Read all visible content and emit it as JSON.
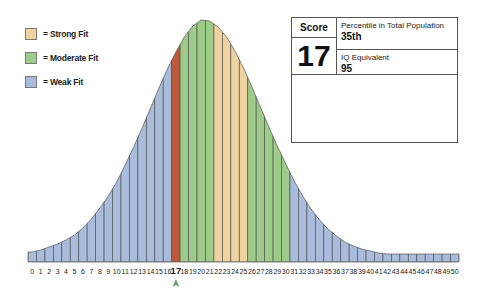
{
  "legend": [
    {
      "label": "= Strong Fit",
      "color": "#f0d3a0"
    },
    {
      "label": "= Moderate Fit",
      "color": "#9ccc88"
    },
    {
      "label": "= Weak Fit",
      "color": "#a9bcdc"
    }
  ],
  "score_box": {
    "score_header": "Score",
    "score_value": "17",
    "percentile_label": "Percentile in Total Population",
    "percentile_value": "35th",
    "iq_label": "IQ Equivalent",
    "iq_value": "95"
  },
  "colors": {
    "strong": "#f0d3a0",
    "moderate": "#9ccc88",
    "weak": "#a9bcdc",
    "current": "#c0583a",
    "marker": "#6aa06a",
    "bar_outline": "#555555"
  },
  "chart_data": {
    "type": "bar",
    "title": "",
    "xlabel": "",
    "ylabel": "",
    "categories": [
      "0",
      "1",
      "2",
      "3",
      "4",
      "5",
      "6",
      "7",
      "8",
      "9",
      "10",
      "11",
      "12",
      "13",
      "14",
      "15",
      "16",
      "17",
      "18",
      "19",
      "20",
      "21",
      "22",
      "23",
      "24",
      "25",
      "26",
      "27",
      "28",
      "29",
      "30",
      "31",
      "32",
      "33",
      "34",
      "35",
      "36",
      "37",
      "38",
      "39",
      "40",
      "41",
      "42",
      "43",
      "44",
      "45",
      "46",
      "47",
      "48",
      "49",
      "50"
    ],
    "values": [
      10,
      12,
      15,
      18,
      22,
      27,
      34,
      43,
      54,
      66,
      80,
      97,
      115,
      134,
      154,
      174,
      193,
      210,
      225,
      236,
      242,
      241,
      235,
      225,
      211,
      194,
      175,
      155,
      135,
      116,
      98,
      81,
      66,
      53,
      42,
      33,
      26,
      20,
      16,
      13,
      11,
      9,
      8,
      8,
      8,
      8,
      8,
      8,
      8,
      8,
      8
    ],
    "bar_category": [
      "weak",
      "weak",
      "weak",
      "weak",
      "weak",
      "weak",
      "weak",
      "weak",
      "weak",
      "weak",
      "weak",
      "weak",
      "weak",
      "weak",
      "weak",
      "weak",
      "weak",
      "current",
      "moderate",
      "moderate",
      "moderate",
      "moderate",
      "strong",
      "strong",
      "strong",
      "strong",
      "moderate",
      "moderate",
      "moderate",
      "moderate",
      "moderate",
      "weak",
      "weak",
      "weak",
      "weak",
      "weak",
      "weak",
      "weak",
      "weak",
      "weak",
      "weak",
      "weak",
      "weak",
      "weak",
      "weak",
      "weak",
      "weak",
      "weak",
      "weak",
      "weak",
      "weak"
    ],
    "highlighted_score": 17,
    "legend": [
      "Strong Fit",
      "Moderate Fit",
      "Weak Fit"
    ],
    "legend_position": "top-left",
    "grid": false
  }
}
